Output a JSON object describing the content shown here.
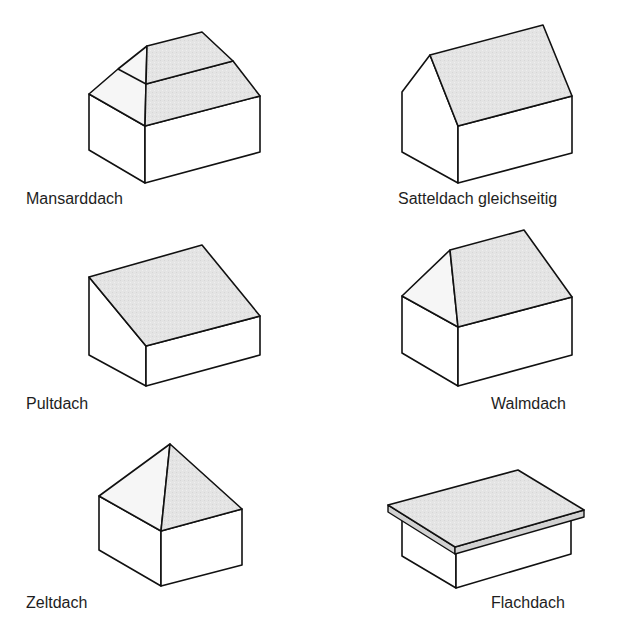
{
  "figure": {
    "items": [
      {
        "id": "mansarddach",
        "label": "Mansarddach"
      },
      {
        "id": "satteldach",
        "label": "Satteldach gleichseitig"
      },
      {
        "id": "pultdach",
        "label": "Pultdach"
      },
      {
        "id": "walmdach",
        "label": "Walmdach"
      },
      {
        "id": "zeltdach",
        "label": "Zeltdach"
      },
      {
        "id": "flachdach",
        "label": "Flachdach"
      }
    ],
    "colors": {
      "roof_fill": "#e3e3e3",
      "line": "#111111",
      "wall": "#ffffff"
    }
  }
}
